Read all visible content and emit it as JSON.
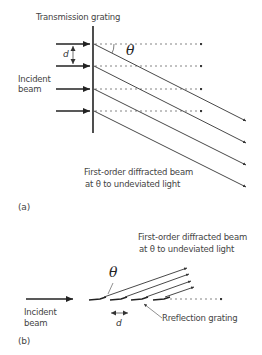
{
  "panel_a": {
    "title": "Transmission grating",
    "incident_label_line1": "Incident",
    "incident_label_line2": "beam",
    "spacing_label": "d",
    "angle_label": "θ",
    "diffracted_label_line1": "First-order diffracted beam",
    "diffracted_label_line2": "at θ to undeviated light",
    "panel_label": "(a)"
  },
  "panel_b": {
    "diffracted_label_line1": "First-order diffracted beam",
    "diffracted_label_line2": "at θ to undeviated light",
    "angle_label": "θ",
    "incident_label_line1": "Incident",
    "incident_label_line2": "beam",
    "spacing_label": "d",
    "grating_label": "Rreflection grating",
    "panel_label": "(b)"
  },
  "colors": {
    "line": "#333333",
    "dotted": "#555555",
    "text": "#444444"
  }
}
